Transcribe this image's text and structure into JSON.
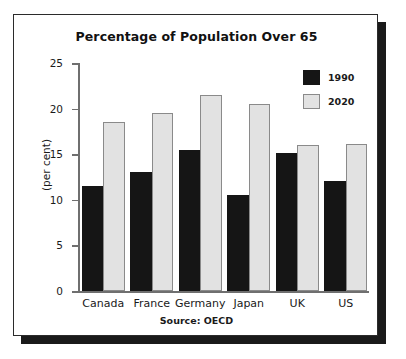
{
  "figure": {
    "source_note": "Source: OECD"
  },
  "legend": {
    "items": [
      {
        "label": "1990",
        "color": "#151515"
      },
      {
        "label": "2020",
        "color": "#e2e2e2"
      }
    ]
  },
  "chart_data": {
    "type": "bar",
    "title": "Percentage of Population Over 65",
    "xlabel": "",
    "ylabel": "(per cent)",
    "ylim": [
      0,
      25
    ],
    "yticks": [
      0,
      5,
      10,
      15,
      20,
      25
    ],
    "ytick_labels": [
      "0",
      "5",
      "10",
      "15",
      "20",
      "25"
    ],
    "grid": false,
    "legend_position": "top-right",
    "categories": [
      "Canada",
      "France",
      "Germany",
      "Japan",
      "UK",
      "US"
    ],
    "series": [
      {
        "name": "1990",
        "color": "#151515",
        "values": [
          11.5,
          13.0,
          15.5,
          10.5,
          15.1,
          12.1
        ]
      },
      {
        "name": "2020",
        "color": "#e2e2e2",
        "values": [
          18.5,
          19.5,
          21.5,
          20.5,
          16.0,
          16.1
        ]
      }
    ]
  }
}
